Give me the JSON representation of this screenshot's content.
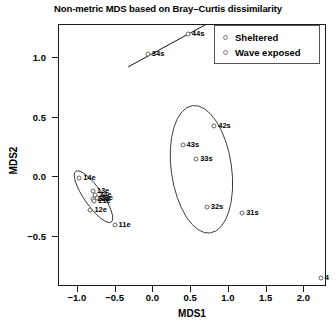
{
  "chart_data": {
    "type": "scatter",
    "title": "Non-metric MDS based on Bray–Curtis dissimilarity",
    "xlabel": "MDS1",
    "ylabel": "MDS2",
    "xlim": [
      -1.25,
      2.3
    ],
    "ylim": [
      -0.92,
      1.28
    ],
    "xticks": [
      -1.0,
      -0.5,
      0.0,
      0.5,
      1.0,
      1.5,
      2.0
    ],
    "xticklabels": [
      "−1.0",
      "−0.5",
      "0.0",
      "0.5",
      "1.0",
      "1.5",
      "2.0"
    ],
    "yticks": [
      1.0,
      0.5,
      0.0,
      -0.5
    ],
    "yticklabels": [
      "1.0",
      "0.5",
      "0.0",
      "−0.5"
    ],
    "grid": false,
    "legend_position": "top-right",
    "legend": [
      {
        "label": "Sheltered",
        "symbol": "open-circle"
      },
      {
        "label": "Wave exposed",
        "symbol": "open-circle"
      }
    ],
    "series": [
      {
        "name": "Sheltered",
        "points": [
          {
            "label": "14e",
            "x": -0.97,
            "y": -0.01
          },
          {
            "label": "13e",
            "x": -0.79,
            "y": -0.12
          },
          {
            "label": "24e",
            "x": -0.76,
            "y": -0.16
          },
          {
            "label": "23e",
            "x": -0.74,
            "y": -0.18
          },
          {
            "label": "22e",
            "x": -0.78,
            "y": -0.19
          },
          {
            "label": "21e",
            "x": -0.77,
            "y": -0.21
          },
          {
            "label": "12e",
            "x": -0.82,
            "y": -0.28
          },
          {
            "label": "11e",
            "x": -0.5,
            "y": -0.41
          }
        ]
      },
      {
        "name": "Wave exposed",
        "points": [
          {
            "label": "34s",
            "x": -0.06,
            "y": 1.03
          },
          {
            "label": "44s",
            "x": 0.47,
            "y": 1.2
          },
          {
            "label": "42s",
            "x": 0.82,
            "y": 0.42
          },
          {
            "label": "43s",
            "x": 0.4,
            "y": 0.26
          },
          {
            "label": "33s",
            "x": 0.58,
            "y": 0.15
          },
          {
            "label": "32s",
            "x": 0.72,
            "y": -0.26
          },
          {
            "label": "31s",
            "x": 1.19,
            "y": -0.31
          },
          {
            "label": "4",
            "x": 2.23,
            "y": -0.85
          }
        ]
      }
    ],
    "ellipses": [
      {
        "group": "Sheltered",
        "cx": -0.78,
        "cy": -0.17,
        "rx": 0.12,
        "ry": 0.26,
        "rotation_deg": -35
      },
      {
        "group": "Wave exposed",
        "cx": 0.65,
        "cy": 0.06,
        "rx": 0.4,
        "ry": 0.54,
        "rotation_deg": -8
      }
    ],
    "annotation_line": {
      "from": {
        "x": -0.32,
        "y": 0.92
      },
      "to": {
        "x": 0.72,
        "y": 1.28
      }
    }
  }
}
